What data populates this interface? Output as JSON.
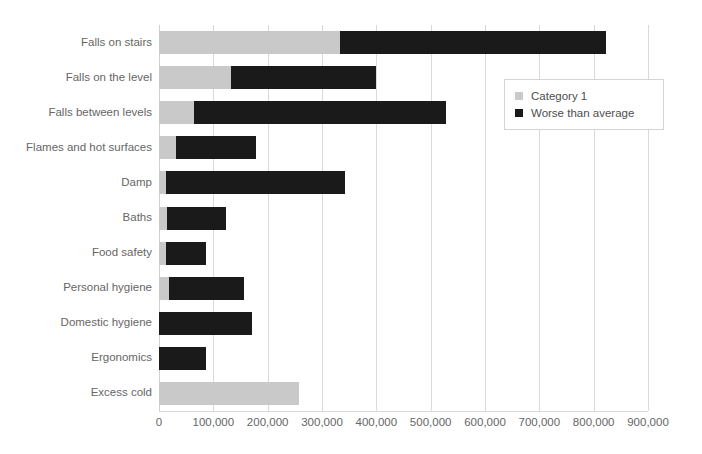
{
  "chart_data": {
    "type": "bar",
    "orientation": "horizontal",
    "stacked": true,
    "title": "",
    "subtitle": "",
    "xlabel": "",
    "ylabel": "",
    "xlim": [
      0,
      900000
    ],
    "xtick_step": 100000,
    "grid": "vertical",
    "legend_position": "top-right",
    "categories": [
      "Falls on stairs",
      "Falls on the level",
      "Falls between levels",
      "Flames and hot surfaces",
      "Damp",
      "Baths",
      "Food safety",
      "Personal hygiene",
      "Domestic hygiene",
      "Ergonomics",
      "Excess  cold"
    ],
    "xtick_labels": [
      "0",
      "100,000",
      "200,000",
      "300,000",
      "400,000",
      "500,000",
      "600,000",
      "700,000",
      "800,000",
      "900,000"
    ],
    "xtick_values": [
      0,
      100000,
      200000,
      300000,
      400000,
      500000,
      600000,
      700000,
      800000,
      900000
    ],
    "series": [
      {
        "name": "Category 1",
        "color": "#c9c9c9",
        "values": [
          333000,
          132000,
          64000,
          32000,
          12000,
          15000,
          12000,
          19000,
          0,
          0,
          257000
        ]
      },
      {
        "name": "Worse than average",
        "color": "#1a1a1a",
        "values": [
          489000,
          267000,
          464000,
          146000,
          331000,
          109000,
          75000,
          137000,
          172000,
          87000,
          0
        ]
      }
    ],
    "totals": [
      822000,
      399000,
      528000,
      178000,
      343000,
      124000,
      87000,
      156000,
      172000,
      87000,
      257000
    ]
  },
  "legend": {
    "items": [
      {
        "label": "Category 1",
        "color": "#c9c9c9"
      },
      {
        "label": "Worse than average",
        "color": "#1a1a1a"
      }
    ]
  },
  "colors": {
    "category_1": "#c9c9c9",
    "worse_than_average": "#1a1a1a",
    "gridline": "#d9d9d9",
    "tick_text": "#666666",
    "background": "#ffffff"
  }
}
